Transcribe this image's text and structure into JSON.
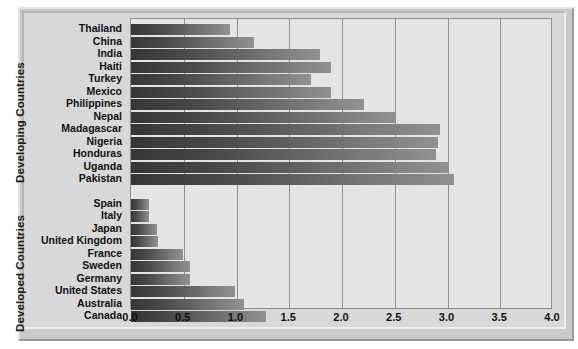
{
  "chart_data": {
    "type": "bar",
    "orientation": "horizontal",
    "title": "",
    "xlabel": "",
    "ylabel": "",
    "xlim": [
      0.0,
      4.0
    ],
    "xticks": [
      "0.0",
      "0.5",
      "1.0",
      "1.5",
      "2.0",
      "2.5",
      "3.0",
      "3.5",
      "4.0"
    ],
    "xtick_values": [
      0.0,
      0.5,
      1.0,
      1.5,
      2.0,
      2.5,
      3.0,
      3.5,
      4.0
    ],
    "grid": true,
    "legend": "none",
    "groups": [
      {
        "name": "Developing Countries",
        "categories": [
          "Thailand",
          "China",
          "India",
          "Haiti",
          "Turkey",
          "Mexico",
          "Philippines",
          "Nepal",
          "Madagascar",
          "Nigeria",
          "Honduras",
          "Uganda",
          "Pakistan"
        ],
        "values": [
          0.94,
          1.17,
          1.79,
          1.9,
          1.71,
          1.9,
          2.21,
          2.5,
          2.93,
          2.91,
          2.89,
          3.01,
          3.06
        ]
      },
      {
        "name": "Developed Countries",
        "categories": [
          "Spain",
          "Italy",
          "Japan",
          "United Kingdom",
          "France",
          "Sweden",
          "Germany",
          "United States",
          "Australia",
          "Canada"
        ],
        "values": [
          0.17,
          0.17,
          0.25,
          0.26,
          0.49,
          0.56,
          0.56,
          0.99,
          1.07,
          1.28
        ]
      }
    ],
    "categories": [
      "Thailand",
      "China",
      "India",
      "Haiti",
      "Turkey",
      "Mexico",
      "Philippines",
      "Nepal",
      "Madagascar",
      "Nigeria",
      "Honduras",
      "Uganda",
      "Pakistan",
      "Spain",
      "Italy",
      "Japan",
      "United Kingdom",
      "France",
      "Sweden",
      "Germany",
      "United States",
      "Australia",
      "Canada"
    ],
    "values": [
      0.94,
      1.17,
      1.79,
      1.9,
      1.71,
      1.9,
      2.21,
      2.5,
      2.93,
      2.91,
      2.89,
      3.01,
      3.06,
      0.17,
      0.17,
      0.25,
      0.26,
      0.49,
      0.56,
      0.56,
      0.99,
      1.07,
      1.28
    ],
    "colors": {
      "bar_gradient_start": "#363636",
      "bar_gradient_end": "#919191",
      "plot_background": "#e4e4e4",
      "gridline": "#8d8d8d",
      "frame": "#c9c9c9",
      "text": "#101010"
    }
  },
  "axis_labels": {
    "developing": "Developing Countries",
    "developed": "Developed Countries"
  }
}
